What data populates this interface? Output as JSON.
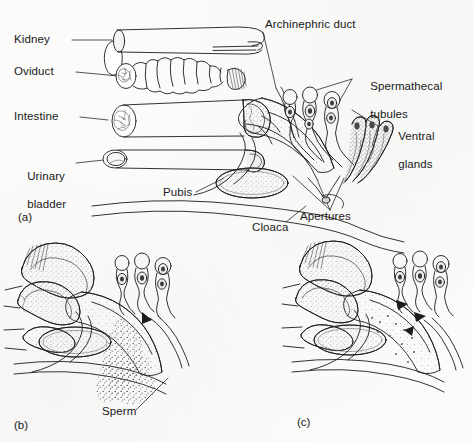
{
  "figure": {
    "background_color": "#fbfbfa",
    "ink_color": "#1c1c1c",
    "stipple_color": "#8a8a8a",
    "panels": [
      {
        "id": "a",
        "label": "(a)"
      },
      {
        "id": "b",
        "label": "(b)"
      },
      {
        "id": "c",
        "label": "(c)"
      }
    ]
  },
  "labels": {
    "kidney": "Kidney",
    "oviduct": "Oviduct",
    "intestine": "Intestine",
    "urinary_bladder_line1": "Urinary",
    "urinary_bladder_line2": "bladder",
    "pubis": "Pubis",
    "cloaca": "Cloaca",
    "archinephric_duct": "Archinephric duct",
    "spermathecal_line1": "Spermathecal",
    "spermathecal_line2": "tubules",
    "ventral_line1": "Ventral",
    "ventral_line2": "glands",
    "apertures": "Apertures",
    "sperm": "Sperm"
  },
  "panel_a_structures": [
    "kidney-tube",
    "oviduct-convoluted-tube",
    "intestine-tube",
    "urinary-bladder-tube",
    "pubis-oval",
    "cloaca-chamber",
    "archinephric-duct",
    "spermathecal-tubules",
    "ventral-glands",
    "apertures"
  ],
  "panel_b_structures": [
    "cloaca-chamber",
    "pubis-oval",
    "spermathecal-tubules",
    "sperm-mass",
    "aperture-arrow"
  ],
  "panel_c_structures": [
    "cloaca-chamber",
    "pubis-oval",
    "spermathecal-tubules",
    "sperm-entry-arrows"
  ]
}
